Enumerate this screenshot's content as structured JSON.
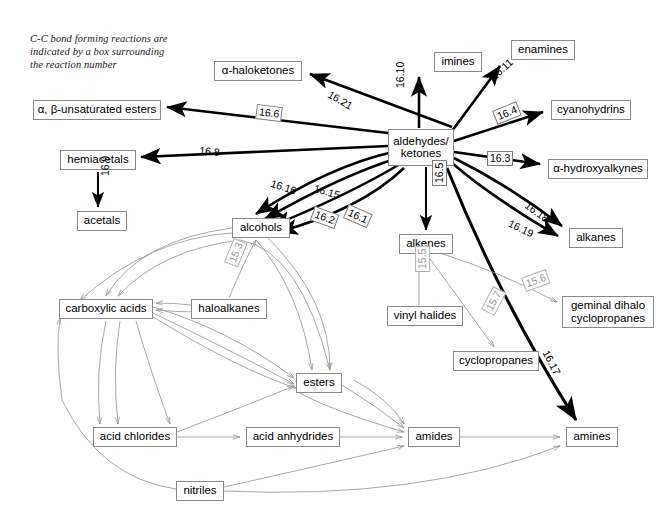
{
  "caption": {
    "text": "C-C bond forming reactions are\nindicated by a box surrounding\nthe reaction number"
  },
  "colors": {
    "bold_edge": "#000000",
    "light_edge": "#9a9a9a",
    "node_border": "#8a8a8a",
    "gray_label": "#9a9a9a"
  },
  "chart_data": {
    "type": "diagram",
    "hub": "aldehydes/ketones",
    "nodes": [
      {
        "id": "aldehydes_ketones",
        "label": "aldehydes/\nketones",
        "x": 388,
        "y": 129,
        "w": 66,
        "h": 37
      },
      {
        "id": "imines",
        "label": "imines",
        "x": 434,
        "y": 52,
        "w": 48,
        "h": 20
      },
      {
        "id": "enamines",
        "label": "enamines",
        "x": 511,
        "y": 40,
        "w": 64,
        "h": 20
      },
      {
        "id": "cyanohydrins",
        "label": "cyanohydrins",
        "x": 551,
        "y": 100,
        "w": 80,
        "h": 20
      },
      {
        "id": "alpha_hydroxyalkynes",
        "label": "α-hydroxyalkynes",
        "x": 548,
        "y": 159,
        "w": 100,
        "h": 20
      },
      {
        "id": "alkanes",
        "label": "alkanes",
        "x": 569,
        "y": 228,
        "w": 54,
        "h": 20
      },
      {
        "id": "alpha_haloketones",
        "label": "α-haloketones",
        "x": 214,
        "y": 61,
        "w": 88,
        "h": 20
      },
      {
        "id": "ab_unsaturated_esters",
        "label": "α, β-unsaturated esters",
        "x": 33,
        "y": 100,
        "w": 128,
        "h": 20
      },
      {
        "id": "hemiacetals",
        "label": "hemiacetals",
        "x": 60,
        "y": 150,
        "w": 76,
        "h": 20
      },
      {
        "id": "acetals",
        "label": "acetals",
        "x": 77,
        "y": 211,
        "w": 50,
        "h": 20
      },
      {
        "id": "alcohols",
        "label": "alcohols",
        "x": 232,
        "y": 218,
        "w": 58,
        "h": 20
      },
      {
        "id": "alkenes",
        "label": "alkenes",
        "x": 399,
        "y": 234,
        "w": 54,
        "h": 20
      },
      {
        "id": "geminal_dihalo_cyclopropanes",
        "label": "geminal dihalo\ncyclopropanes",
        "x": 562,
        "y": 296,
        "w": 92,
        "h": 32
      },
      {
        "id": "cyclopropanes",
        "label": "cyclopropanes",
        "x": 453,
        "y": 351,
        "w": 86,
        "h": 20
      },
      {
        "id": "vinyl_halides",
        "label": "vinyl halides",
        "x": 387,
        "y": 306,
        "w": 76,
        "h": 20
      },
      {
        "id": "carboxylic_acids",
        "label": "carboxylic acids",
        "x": 59,
        "y": 299,
        "w": 94,
        "h": 20
      },
      {
        "id": "haloalkanes",
        "label": "haloalkanes",
        "x": 191,
        "y": 299,
        "w": 76,
        "h": 20
      },
      {
        "id": "esters",
        "label": "esters",
        "x": 296,
        "y": 373,
        "w": 46,
        "h": 20
      },
      {
        "id": "acid_chlorides",
        "label": "acid chlorides",
        "x": 93,
        "y": 427,
        "w": 84,
        "h": 20
      },
      {
        "id": "acid_anhydrides",
        "label": "acid anhydrides",
        "x": 246,
        "y": 427,
        "w": 94,
        "h": 20
      },
      {
        "id": "amides",
        "label": "amides",
        "x": 408,
        "y": 427,
        "w": 52,
        "h": 20
      },
      {
        "id": "amines",
        "label": "amines",
        "x": 566,
        "y": 427,
        "w": 52,
        "h": 20
      },
      {
        "id": "nitriles",
        "label": "nitriles",
        "x": 176,
        "y": 481,
        "w": 48,
        "h": 20
      }
    ],
    "edges": [
      {
        "from": "aldehydes_ketones",
        "to": "imines",
        "label": "16.10",
        "boxed": false,
        "style": "bold"
      },
      {
        "from": "aldehydes_ketones",
        "to": "enamines",
        "label": "16.11",
        "boxed": false,
        "style": "bold"
      },
      {
        "from": "aldehydes_ketones",
        "to": "cyanohydrins",
        "label": "16.4",
        "boxed": true,
        "style": "bold"
      },
      {
        "from": "aldehydes_ketones",
        "to": "alpha_hydroxyalkynes",
        "label": "16.3",
        "boxed": true,
        "style": "bold"
      },
      {
        "from": "aldehydes_ketones",
        "to": "alkanes",
        "label": "16.18",
        "boxed": false,
        "style": "bold"
      },
      {
        "from": "aldehydes_ketones",
        "to": "alkanes",
        "label": "16.19",
        "boxed": false,
        "style": "bold"
      },
      {
        "from": "aldehydes_ketones",
        "to": "alpha_haloketones",
        "label": "16.21",
        "boxed": false,
        "style": "bold"
      },
      {
        "from": "aldehydes_ketones",
        "to": "ab_unsaturated_esters",
        "label": "16.6",
        "boxed": true,
        "style": "bold"
      },
      {
        "from": "aldehydes_ketones",
        "to": "hemiacetals",
        "label": "16.8",
        "boxed": false,
        "style": "bold"
      },
      {
        "from": "hemiacetals",
        "to": "acetals",
        "label": "16.9",
        "boxed": false,
        "style": "bold"
      },
      {
        "from": "aldehydes_ketones",
        "to": "alcohols",
        "label": "16.16",
        "boxed": false,
        "style": "bold"
      },
      {
        "from": "aldehydes_ketones",
        "to": "alcohols",
        "label": "16.15",
        "boxed": false,
        "style": "bold"
      },
      {
        "from": "aldehydes_ketones",
        "to": "alcohols",
        "label": "16.2",
        "boxed": true,
        "style": "bold"
      },
      {
        "from": "aldehydes_ketones",
        "to": "alcohols",
        "label": "16.1",
        "boxed": true,
        "style": "bold"
      },
      {
        "from": "aldehydes_ketones",
        "to": "alkenes",
        "label": "16.5",
        "boxed": true,
        "style": "bold"
      },
      {
        "from": "aldehydes_ketones",
        "to": "amines",
        "label": "16.17",
        "boxed": false,
        "style": "bold"
      },
      {
        "from": "haloalkanes",
        "to": "alcohols",
        "label": "15.3",
        "boxed": true,
        "style": "light"
      },
      {
        "from": "vinyl_halides",
        "to": "alkenes",
        "label": "15.5",
        "boxed": true,
        "style": "light"
      },
      {
        "from": "alkenes",
        "to": "geminal_dihalo_cyclopropanes",
        "label": "15.6",
        "boxed": true,
        "style": "light"
      },
      {
        "from": "alkenes",
        "to": "cyclopropanes",
        "label": "15.7",
        "boxed": true,
        "style": "light"
      },
      {
        "from": "acid_chlorides",
        "to": "acid_anhydrides",
        "label": "",
        "boxed": false,
        "style": "light"
      },
      {
        "from": "acid_anhydrides",
        "to": "amides",
        "label": "",
        "boxed": false,
        "style": "light"
      },
      {
        "from": "amides",
        "to": "amines",
        "label": "",
        "boxed": false,
        "style": "light"
      },
      {
        "from": "esters",
        "to": "amides",
        "label": "",
        "boxed": false,
        "style": "light"
      },
      {
        "from": "haloalkanes",
        "to": "carboxylic_acids",
        "label": "",
        "boxed": false,
        "style": "light"
      },
      {
        "from": "carboxylic_acids",
        "to": "esters",
        "label": "",
        "boxed": false,
        "style": "light"
      },
      {
        "from": "nitriles",
        "to": "carboxylic_acids",
        "label": "",
        "boxed": false,
        "style": "light"
      },
      {
        "from": "nitriles",
        "to": "amines",
        "label": "",
        "boxed": false,
        "style": "light"
      }
    ],
    "labels": [
      {
        "text": "16.10",
        "x": 394,
        "y": 88,
        "rot": -90,
        "boxed": false,
        "gray": false
      },
      {
        "text": "16.11",
        "x": 488,
        "y": 73,
        "rot": -42,
        "boxed": false,
        "gray": false
      },
      {
        "text": "16.4",
        "x": 492,
        "y": 111,
        "rot": -22,
        "boxed": true,
        "gray": false
      },
      {
        "text": "16.3",
        "x": 487,
        "y": 151,
        "rot": 0,
        "boxed": true,
        "gray": false
      },
      {
        "text": "16.18",
        "x": 530,
        "y": 199,
        "rot": 36,
        "boxed": false,
        "gray": false
      },
      {
        "text": "16.19",
        "x": 512,
        "y": 217,
        "rot": 26,
        "boxed": false,
        "gray": false
      },
      {
        "text": "16.21",
        "x": 332,
        "y": 88,
        "rot": 30,
        "boxed": false,
        "gray": false
      },
      {
        "text": "16.6",
        "x": 257,
        "y": 104,
        "rot": 7,
        "boxed": true,
        "gray": false
      },
      {
        "text": "16.8",
        "x": 200,
        "y": 144,
        "rot": 6,
        "boxed": false,
        "gray": false
      },
      {
        "text": "16.9",
        "x": 99,
        "y": 176,
        "rot": -90,
        "boxed": false,
        "gray": false
      },
      {
        "text": "16.16",
        "x": 273,
        "y": 177,
        "rot": 18,
        "boxed": false,
        "gray": false
      },
      {
        "text": "16.15",
        "x": 316,
        "y": 182,
        "rot": 16,
        "boxed": false,
        "gray": false
      },
      {
        "text": "16.2",
        "x": 315,
        "y": 206,
        "rot": 20,
        "boxed": true,
        "gray": false
      },
      {
        "text": "16.1",
        "x": 349,
        "y": 204,
        "rot": 24,
        "boxed": true,
        "gray": false
      },
      {
        "text": "16.5",
        "x": 432,
        "y": 186,
        "rot": -90,
        "boxed": true,
        "gray": false
      },
      {
        "text": "16.17",
        "x": 551,
        "y": 348,
        "rot": 62,
        "boxed": false,
        "gray": false
      },
      {
        "text": "15.3",
        "x": 224,
        "y": 262,
        "rot": -68,
        "boxed": true,
        "gray": true
      },
      {
        "text": "15.5",
        "x": 415,
        "y": 272,
        "rot": -90,
        "boxed": true,
        "gray": true
      },
      {
        "text": "15.6",
        "x": 521,
        "y": 278,
        "rot": -20,
        "boxed": true,
        "gray": true
      },
      {
        "text": "15.7",
        "x": 481,
        "y": 309,
        "rot": -62,
        "boxed": true,
        "gray": true
      }
    ]
  }
}
